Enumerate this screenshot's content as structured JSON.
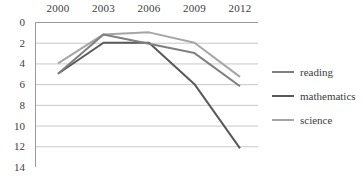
{
  "chart_data": {
    "type": "line",
    "title": "",
    "xlabel": "",
    "ylabel": "",
    "categories": [
      "2000",
      "2003",
      "2006",
      "2009",
      "2012"
    ],
    "x_axis_position": "top",
    "y_axis_inverted": true,
    "ylim": [
      0,
      14
    ],
    "y_ticks": [
      "0",
      "2",
      "4",
      "6",
      "8",
      "10",
      "12",
      "14"
    ],
    "grid": "horizontal",
    "legend_position": "right",
    "series": [
      {
        "name": "reading",
        "color": "#7f7f7f",
        "values": [
          5.0,
          1.2,
          2.1,
          3.0,
          6.2
        ]
      },
      {
        "name": "mathematics",
        "color": "#595959",
        "values": [
          5.0,
          2.0,
          2.0,
          6.0,
          12.2
        ]
      },
      {
        "name": "science",
        "color": "#a6a6a6",
        "values": [
          4.0,
          1.2,
          1.0,
          2.0,
          5.3
        ]
      }
    ]
  },
  "axis": {
    "x_labels": [
      "2000",
      "2003",
      "2006",
      "2009",
      "2012"
    ],
    "y_labels": [
      "0",
      "2",
      "4",
      "6",
      "8",
      "10",
      "12",
      "14"
    ]
  },
  "legend": {
    "items": [
      {
        "label": "reading",
        "color": "#7f7f7f"
      },
      {
        "label": "mathematics",
        "color": "#595959"
      },
      {
        "label": "science",
        "color": "#a6a6a6"
      }
    ]
  },
  "colors": {
    "grid": "#c8c8c8",
    "axis": "#9a9a9a",
    "text": "#3c3c3c",
    "background": "#ffffff"
  }
}
